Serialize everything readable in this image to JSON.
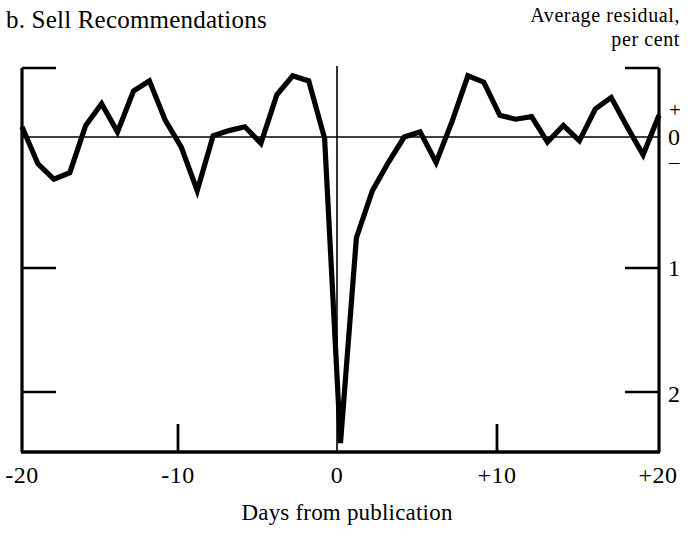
{
  "chart_data": {
    "type": "line",
    "title": "b. Sell Recommendations",
    "subtitle": "",
    "xlabel": "Days from publication",
    "ylabel": "Average residual, per cent",
    "ylabel_line1": "Average residual,",
    "ylabel_line2": "per cent",
    "x": [
      -20,
      -19,
      -18,
      -17,
      -16,
      -15,
      -14,
      -13,
      -12,
      -11,
      -10,
      -9,
      -8,
      -7,
      -6,
      -5,
      -4,
      -3,
      -2,
      -1,
      0,
      1,
      2,
      3,
      4,
      5,
      6,
      7,
      8,
      9,
      10,
      11,
      12,
      13,
      14,
      15,
      16,
      17,
      18,
      19,
      20
    ],
    "values": [
      0.08,
      -0.21,
      -0.33,
      -0.28,
      0.09,
      0.26,
      0.04,
      0.36,
      0.44,
      0.13,
      -0.08,
      -0.42,
      0.01,
      0.05,
      0.08,
      -0.05,
      0.33,
      0.48,
      0.44,
      -0.01,
      -2.4,
      -0.79,
      -0.42,
      -0.2,
      0.0,
      0.04,
      -0.2,
      0.12,
      0.48,
      0.43,
      0.17,
      0.14,
      0.16,
      -0.04,
      0.09,
      -0.03,
      0.22,
      0.31,
      0.08,
      -0.14,
      0.17
    ],
    "x_ticks": [
      -20,
      -10,
      0,
      10,
      20
    ],
    "x_tick_labels": [
      "-20",
      "-10",
      "0",
      "+10",
      "+20"
    ],
    "y_ticks": [
      0,
      -1,
      -2
    ],
    "y_tick_labels": [
      "0",
      "1",
      "2"
    ],
    "y_sign_plus": "+",
    "y_sign_minus": "–",
    "xlim": [
      -20,
      20
    ],
    "ylim": [
      -2.6,
      0.75
    ],
    "grid": false,
    "legend": "none",
    "zero_line": true,
    "event_line_x": 0,
    "series_color": "#000000",
    "axis_color": "#000000",
    "background": "#ffffff"
  }
}
